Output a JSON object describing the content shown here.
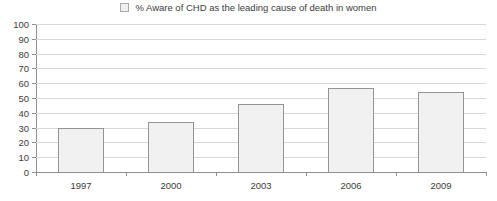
{
  "legend": {
    "swatch_name": "legend-swatch",
    "label": "% Aware of CHD as the leading cause of death in women"
  },
  "colors": {
    "bar_fill": "#f1f1f1",
    "bar_border": "#949494",
    "gridline": "#d8d8d8",
    "axis": "#8f8f8f",
    "text": "#3c3c3c",
    "background": "#ffffff"
  },
  "chart_data": {
    "type": "bar",
    "title": "",
    "subtitle": "",
    "xlabel": "",
    "ylabel": "",
    "categories": [
      "1997",
      "2000",
      "2003",
      "2006",
      "2009"
    ],
    "values": [
      30,
      34,
      46,
      57,
      54
    ],
    "series": [
      {
        "name": "% Aware of CHD as the leading cause of death in women",
        "values": [
          30,
          34,
          46,
          57,
          54
        ]
      }
    ],
    "ylim": [
      0,
      100
    ],
    "ytick_step": 10,
    "yticks": [
      0,
      10,
      20,
      30,
      40,
      50,
      60,
      70,
      80,
      90,
      100
    ],
    "ytick_labels": [
      "0",
      "10",
      "20",
      "30",
      "40",
      "50",
      "60",
      "70",
      "80",
      "90",
      "100"
    ],
    "grid": true,
    "grid_axis": "y",
    "legend": true,
    "legend_position": "top-center"
  }
}
